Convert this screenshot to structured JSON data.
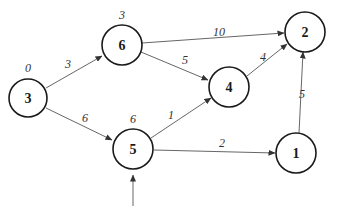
{
  "diagram": {
    "type": "weighted directed graph",
    "nodes": [
      {
        "id": "3",
        "label": "3",
        "x": 28,
        "y": 98,
        "dist": "0"
      },
      {
        "id": "6",
        "label": "6",
        "x": 122,
        "y": 45,
        "dist": "3"
      },
      {
        "id": "2",
        "label": "2",
        "x": 305,
        "y": 32,
        "dist": ""
      },
      {
        "id": "4",
        "label": "4",
        "x": 229,
        "y": 87,
        "dist": ""
      },
      {
        "id": "5",
        "label": "5",
        "x": 133,
        "y": 149,
        "dist": "6"
      },
      {
        "id": "1",
        "label": "1",
        "x": 296,
        "y": 153,
        "dist": ""
      }
    ],
    "edges": [
      {
        "from": "3",
        "to": "6",
        "weight": "3"
      },
      {
        "from": "3",
        "to": "5",
        "weight": "6"
      },
      {
        "from": "6",
        "to": "2",
        "weight": "10"
      },
      {
        "from": "6",
        "to": "4",
        "weight": "5"
      },
      {
        "from": "5",
        "to": "4",
        "weight": "1"
      },
      {
        "from": "4",
        "to": "2",
        "weight": "4"
      },
      {
        "from": "5",
        "to": "1",
        "weight": "2"
      },
      {
        "from": "1",
        "to": "2",
        "weight": "5"
      }
    ],
    "incoming_arrow_to": "5"
  }
}
